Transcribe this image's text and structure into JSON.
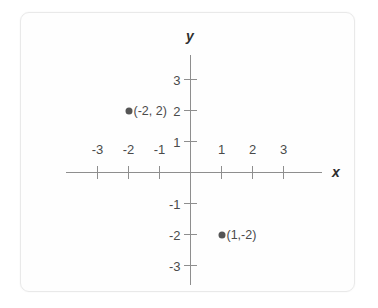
{
  "chart_data": {
    "type": "scatter",
    "title": "",
    "xlabel": "x",
    "ylabel": "y",
    "xlim": [
      -3.9,
      4.2
    ],
    "ylim": [
      -3.8,
      3.8
    ],
    "grid": false,
    "legend": null,
    "x_ticks": [
      {
        "value": -3,
        "label": "-3"
      },
      {
        "value": -2,
        "label": "-2"
      },
      {
        "value": -1,
        "label": "-1"
      },
      {
        "value": 1,
        "label": "1"
      },
      {
        "value": 2,
        "label": "2"
      },
      {
        "value": 3,
        "label": "3"
      }
    ],
    "y_ticks": [
      {
        "value": 3,
        "label": "3"
      },
      {
        "value": 2,
        "label": "2"
      },
      {
        "value": 1,
        "label": "1"
      },
      {
        "value": -1,
        "label": "-1"
      },
      {
        "value": -2,
        "label": "-2"
      },
      {
        "value": -3,
        "label": "-3"
      }
    ],
    "points": [
      {
        "x": -2,
        "y": 2,
        "label": "(-2, 2)"
      },
      {
        "x": 1,
        "y": -2,
        "label": "(1,-2)"
      }
    ],
    "axis_color": "#8e8e8e",
    "point_color": "#555555",
    "text_color": "#4a4a4a"
  }
}
